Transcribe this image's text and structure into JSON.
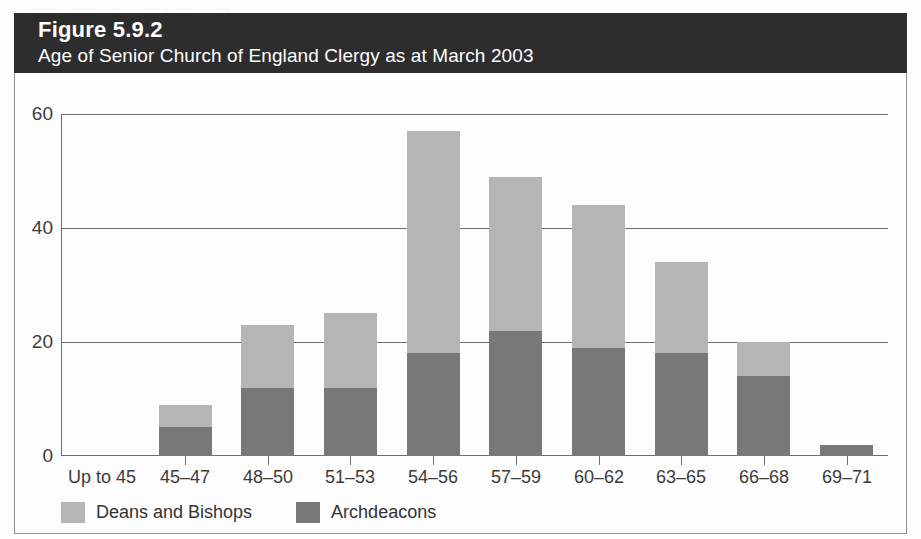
{
  "scan": {
    "cutoff_text": "…………  ………, ……………,  ……………,"
  },
  "figure": {
    "number_label": "Figure 5.9.2",
    "title": "Age of Senior Church of England Clergy as at March 2003",
    "header_bg": "#2d2d2d",
    "border_color": "#8e8e8e"
  },
  "legend": {
    "position": "bottom-left",
    "items": [
      {
        "label": "Deans and Bishops",
        "color": "#b5b5b5",
        "swatch_name": "legend-swatch-deans-and-bishops"
      },
      {
        "label": "Archdeacons",
        "color": "#787878",
        "swatch_name": "legend-swatch-archdeacons"
      }
    ]
  },
  "chart_data": {
    "type": "bar",
    "stacked": true,
    "title": "Age of Senior Church of England Clergy as at March 2003",
    "xlabel": "",
    "ylabel": "",
    "ylim": [
      0,
      60
    ],
    "yticks": [
      0,
      20,
      40,
      60
    ],
    "ytick_labels": [
      "0",
      "20",
      "40",
      "60"
    ],
    "grid": "horizontal",
    "categories": [
      "Up to 45",
      "45–47",
      "48–50",
      "51–53",
      "54–56",
      "57–59",
      "60–62",
      "63–65",
      "66–68",
      "69–71"
    ],
    "series": [
      {
        "name": "Archdeacons",
        "color": "#787878",
        "values": [
          0,
          5,
          12,
          12,
          18,
          22,
          19,
          18,
          14,
          2
        ]
      },
      {
        "name": "Deans and Bishops",
        "color": "#b5b5b5",
        "values": [
          0,
          4,
          11,
          13,
          39,
          27,
          25,
          16,
          6,
          0
        ]
      }
    ],
    "totals": [
      0,
      9,
      23,
      25,
      57,
      49,
      44,
      34,
      20,
      2
    ],
    "legend_position": "bottom-left"
  }
}
